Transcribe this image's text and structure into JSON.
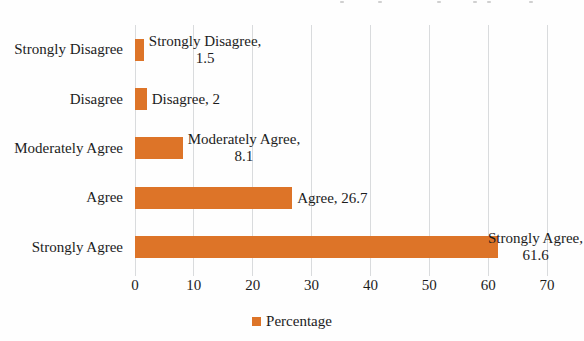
{
  "chart_data": {
    "type": "bar",
    "orientation": "horizontal",
    "title": "",
    "xlabel": "",
    "ylabel": "",
    "categories": [
      "Strongly Disagree",
      "Disagree",
      "Moderately Agree",
      "Agree",
      "Strongly Agree"
    ],
    "values": [
      1.5,
      2,
      8.1,
      26.7,
      61.6
    ],
    "data_labels": [
      [
        "Strongly Disagree,",
        "1.5"
      ],
      [
        "Disagree, 2"
      ],
      [
        "Moderately Agree,",
        "8.1"
      ],
      [
        "Agree, 26.7"
      ],
      [
        "Strongly Agree,",
        "61.6"
      ]
    ],
    "xlim": [
      0,
      70
    ],
    "x_ticks": [
      "0",
      "10",
      "20",
      "30",
      "40",
      "50",
      "60",
      "70"
    ],
    "grid": "vertical-major",
    "legend": {
      "position": "bottom-center",
      "entries": [
        {
          "label": "Percentage",
          "color": "#dd7428"
        }
      ]
    },
    "colors": {
      "bar": "#dd7428",
      "gridline": "#d9dbdd",
      "text": "#1c1c1c"
    }
  }
}
